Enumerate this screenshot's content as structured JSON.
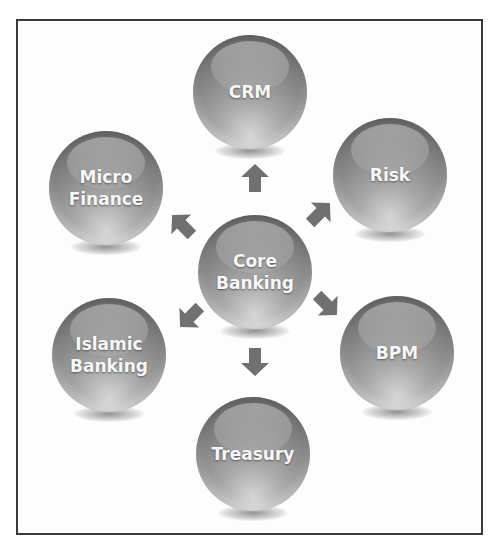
{
  "diagram": {
    "type": "hub-and-spoke",
    "center": {
      "id": "core",
      "label": "Core\nBanking"
    },
    "nodes": [
      {
        "id": "crm",
        "label": "CRM"
      },
      {
        "id": "risk",
        "label": "Risk"
      },
      {
        "id": "bpm",
        "label": "BPM"
      },
      {
        "id": "treasury",
        "label": "Treasury"
      },
      {
        "id": "islamic",
        "label": "Islamic\nBanking"
      },
      {
        "id": "micro",
        "label": "Micro\nFinance"
      }
    ],
    "edges": [
      {
        "from": "core",
        "to": "crm",
        "direction": "up"
      },
      {
        "from": "core",
        "to": "risk",
        "direction": "up-right"
      },
      {
        "from": "core",
        "to": "bpm",
        "direction": "down-right"
      },
      {
        "from": "core",
        "to": "treasury",
        "direction": "down"
      },
      {
        "from": "core",
        "to": "islamic",
        "direction": "down-left"
      },
      {
        "from": "core",
        "to": "micro",
        "direction": "up-left"
      }
    ],
    "colors": {
      "sphere": "#8a8a8a",
      "arrow": "#6e6e6e",
      "text": "#f7f7f7",
      "border": "#3a3a3a"
    }
  }
}
